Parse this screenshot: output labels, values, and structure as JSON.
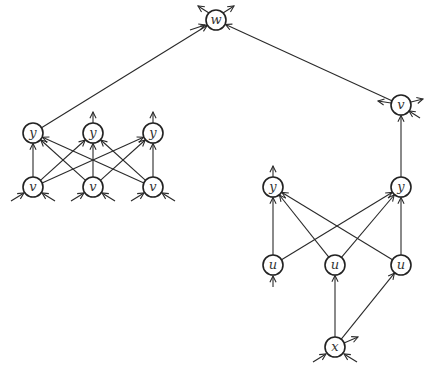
{
  "diagram": {
    "type": "directed-graph",
    "nodes": [
      {
        "id": "w",
        "label": "w",
        "x": 216,
        "y": 20
      },
      {
        "id": "yL1",
        "label": "y",
        "x": 33,
        "y": 133
      },
      {
        "id": "yL2",
        "label": "y",
        "x": 93,
        "y": 133
      },
      {
        "id": "yL3",
        "label": "y",
        "x": 153,
        "y": 133
      },
      {
        "id": "vL1",
        "label": "v",
        "x": 33,
        "y": 187
      },
      {
        "id": "vL2",
        "label": "v",
        "x": 93,
        "y": 187
      },
      {
        "id": "vL3",
        "label": "v",
        "x": 153,
        "y": 187
      },
      {
        "id": "vR",
        "label": "v",
        "x": 401,
        "y": 105
      },
      {
        "id": "yR1",
        "label": "y",
        "x": 273,
        "y": 187
      },
      {
        "id": "yR2",
        "label": "y",
        "x": 401,
        "y": 187
      },
      {
        "id": "u1",
        "label": "u",
        "x": 273,
        "y": 265
      },
      {
        "id": "u2",
        "label": "u",
        "x": 335,
        "y": 265
      },
      {
        "id": "u3",
        "label": "u",
        "x": 401,
        "y": 265
      },
      {
        "id": "x",
        "label": "x",
        "x": 335,
        "y": 347
      }
    ],
    "edges": [
      {
        "from": "yL1",
        "to": "w"
      },
      {
        "from": "vR",
        "to": "w"
      },
      {
        "from": "vL1",
        "to": "yL1"
      },
      {
        "from": "vL1",
        "to": "yL2"
      },
      {
        "from": "vL1",
        "to": "yL3"
      },
      {
        "from": "vL2",
        "to": "yL1"
      },
      {
        "from": "vL2",
        "to": "yL2"
      },
      {
        "from": "vL2",
        "to": "yL3"
      },
      {
        "from": "vL3",
        "to": "yL1"
      },
      {
        "from": "vL3",
        "to": "yL2"
      },
      {
        "from": "vL3",
        "to": "yL3"
      },
      {
        "from": "yR2",
        "to": "vR"
      },
      {
        "from": "u1",
        "to": "yR1"
      },
      {
        "from": "u1",
        "to": "yR2"
      },
      {
        "from": "u2",
        "to": "yR1"
      },
      {
        "from": "u2",
        "to": "yR2"
      },
      {
        "from": "u3",
        "to": "yR1"
      },
      {
        "from": "u3",
        "to": "yR2"
      },
      {
        "from": "x",
        "to": "u2"
      },
      {
        "from": "x",
        "to": "u3"
      }
    ]
  }
}
